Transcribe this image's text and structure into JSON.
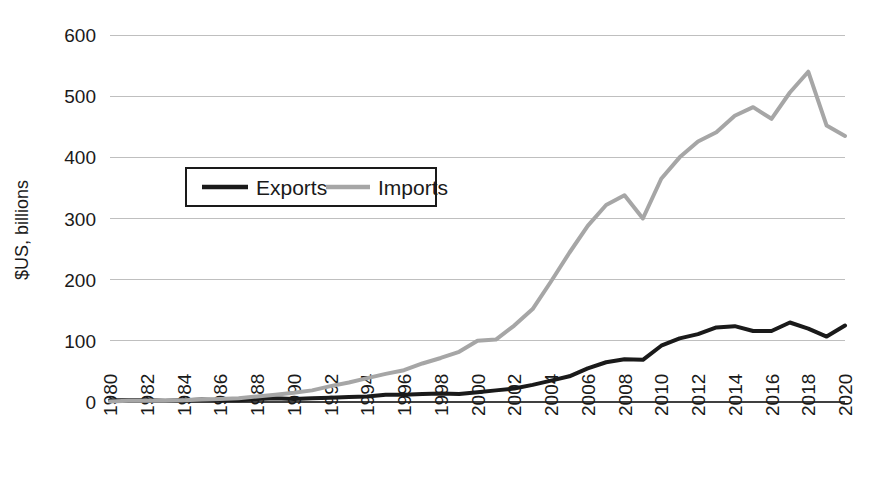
{
  "chart_data": {
    "type": "line",
    "title": "",
    "subtitle": "",
    "xlabel": "",
    "ylabel": "$US, billions",
    "ylim": [
      0,
      600
    ],
    "ytick_labels": [
      "0",
      "100",
      "200",
      "300",
      "400",
      "500",
      "600"
    ],
    "yticks": [
      0,
      100,
      200,
      300,
      400,
      500,
      600
    ],
    "grid": true,
    "legend_position": "upper-left-inside",
    "xlim": [
      1980,
      2020
    ],
    "xtick_labels": [
      "1980",
      "1982",
      "1984",
      "1986",
      "1988",
      "1990",
      "1992",
      "1994",
      "1996",
      "1998",
      "2000",
      "2002",
      "2004",
      "2006",
      "2008",
      "2010",
      "2012",
      "2014",
      "2016",
      "2018",
      "2020"
    ],
    "xticks": [
      1980,
      1982,
      1984,
      1986,
      1988,
      1990,
      1992,
      1994,
      1996,
      1998,
      2000,
      2002,
      2004,
      2006,
      2008,
      2010,
      2012,
      2014,
      2016,
      2018,
      2020
    ],
    "x": [
      1980,
      1981,
      1982,
      1983,
      1984,
      1985,
      1986,
      1987,
      1988,
      1989,
      1990,
      1991,
      1992,
      1993,
      1994,
      1995,
      1996,
      1997,
      1998,
      1999,
      2000,
      2001,
      2002,
      2003,
      2004,
      2005,
      2006,
      2007,
      2008,
      2009,
      2010,
      2011,
      2012,
      2013,
      2014,
      2015,
      2016,
      2017,
      2018,
      2019,
      2020
    ],
    "series": [
      {
        "name": "Exports",
        "color": "#1a1a1a",
        "width": 4,
        "values": [
          3,
          3,
          3,
          2,
          3,
          4,
          3,
          3,
          5,
          6,
          5,
          6,
          7,
          8,
          9,
          12,
          12,
          13,
          14,
          13,
          16,
          19,
          22,
          28,
          35,
          42,
          55,
          65,
          70,
          69,
          92,
          104,
          111,
          122,
          124,
          116,
          116,
          130,
          120,
          107,
          125
        ]
      },
      {
        "name": "Imports",
        "color": "#a6a6a6",
        "width": 4,
        "values": [
          1,
          2,
          2,
          2,
          3,
          4,
          5,
          6,
          9,
          12,
          15,
          19,
          26,
          32,
          39,
          46,
          52,
          63,
          72,
          82,
          100,
          102,
          125,
          152,
          197,
          244,
          288,
          322,
          338,
          300,
          365,
          400,
          426,
          441,
          468,
          482,
          463,
          506,
          540,
          452,
          435
        ]
      }
    ]
  },
  "legend": {
    "items": [
      {
        "label": "Exports",
        "color": "#1a1a1a"
      },
      {
        "label": "Imports",
        "color": "#a6a6a6"
      }
    ]
  }
}
